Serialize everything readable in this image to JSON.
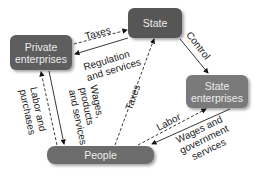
{
  "nodes": {
    "private_enterprises": "Private enterprises",
    "state": "State",
    "state_enterprises": "State enterprises",
    "people": "People"
  },
  "edges": [
    {
      "from": "Private enterprises",
      "to": "State",
      "label": "Taxes",
      "style": "dashed"
    },
    {
      "from": "State",
      "to": "Private enterprises",
      "label": "Regulation and services",
      "style": "solid"
    },
    {
      "from": "State",
      "to": "State enterprises",
      "label": "Control",
      "style": "solid"
    },
    {
      "from": "People",
      "to": "State",
      "label": "Taxes",
      "style": "dashed"
    },
    {
      "from": "People",
      "to": "Private enterprises",
      "label": "Labor and purchases",
      "style": "dashed"
    },
    {
      "from": "Private enterprises",
      "to": "People",
      "label": "Wages, products and services",
      "style": "solid"
    },
    {
      "from": "People",
      "to": "State enterprises",
      "label": "Labor",
      "style": "dashed"
    },
    {
      "from": "State enterprises",
      "to": "People",
      "label": "Wages and government services",
      "style": "solid"
    }
  ],
  "labels": {
    "taxes_top": "Taxes",
    "regulation_1": "Regulation",
    "regulation_2": "and services",
    "control": "Control",
    "taxes_people": "Taxes",
    "labor_purchases_1": "Labor and",
    "labor_purchases_2": "purchases",
    "wages_1": "Wages,",
    "wages_2": "products",
    "wages_3": "and services",
    "labor": "Labor",
    "gov_1": "Wages and",
    "gov_2": "government",
    "gov_3": "services"
  }
}
